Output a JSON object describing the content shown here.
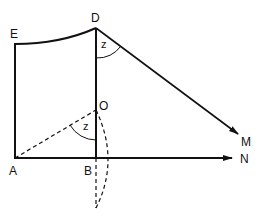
{
  "diagram": {
    "type": "geometry",
    "points": {
      "E": "E",
      "D": "D",
      "O": "O",
      "A": "A",
      "B": "B",
      "M": "M",
      "N": "N"
    },
    "angles": {
      "at_D": "z",
      "at_O": "z"
    },
    "color": "#111111"
  }
}
